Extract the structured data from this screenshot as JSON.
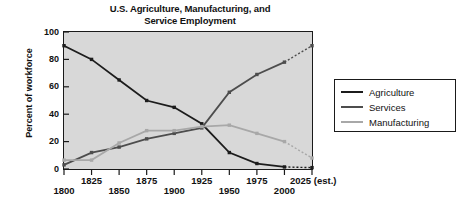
{
  "chart_data": {
    "type": "line",
    "title": "U.S. Agriculture, Manufacturing, and Service Employment",
    "title_line1": "U.S. Agriculture, Manufacturing, and",
    "title_line2": "Service Employment",
    "xlabel": "",
    "ylabel": "Percent of workforce",
    "ylim": [
      0,
      100
    ],
    "yticks": [
      0,
      20,
      40,
      60,
      80,
      100
    ],
    "ytick_labels": [
      "0",
      "20",
      "40",
      "60",
      "80",
      "100"
    ],
    "grid": false,
    "legend_position": "right",
    "categories": [
      1800,
      1825,
      1850,
      1875,
      1900,
      1925,
      1950,
      1975,
      2000,
      2025
    ],
    "xtick_labels": [
      "1800",
      "1825",
      "1850",
      "1875",
      "1900",
      "1925",
      "1950",
      "1975",
      "2000",
      "2025 (est.)"
    ],
    "xtick_last_note": "(est.)",
    "series": [
      {
        "name": "Agriculture",
        "color": "#1c1c1c",
        "values": [
          90,
          80,
          65,
          50,
          45,
          33,
          12,
          4,
          1.5,
          1
        ],
        "forecast_from": 2000
      },
      {
        "name": "Services",
        "color": "#4d4d4d",
        "values": [
          3,
          12,
          16,
          22,
          26,
          30,
          56,
          69,
          78,
          90
        ],
        "forecast_from": 2000
      },
      {
        "name": "Manufacturing",
        "color": "#a8a8a8",
        "values": [
          6.5,
          6.5,
          19,
          28,
          28,
          31,
          32,
          26,
          20,
          8
        ],
        "forecast_from": 2000
      }
    ]
  },
  "legend": {
    "entries": [
      {
        "label": "Agriculture"
      },
      {
        "label": "Services"
      },
      {
        "label": "Manufacturing"
      }
    ]
  },
  "colors": {
    "plot_background": "#d8d8d8",
    "axis": "#1a1a1a",
    "page_background": "#ffffff",
    "agriculture": "#1c1c1c",
    "services": "#4d4d4d",
    "manufacturing": "#a8a8a8"
  }
}
